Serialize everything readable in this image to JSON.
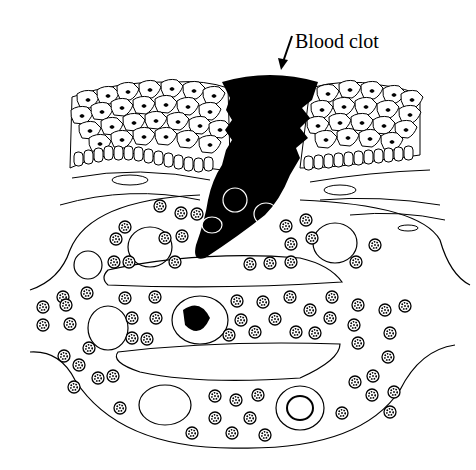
{
  "figure": {
    "labels": [
      {
        "text": "Blood clot",
        "target": "clot"
      }
    ]
  },
  "colors": {
    "ink": "#000000",
    "background": "#ffffff"
  }
}
